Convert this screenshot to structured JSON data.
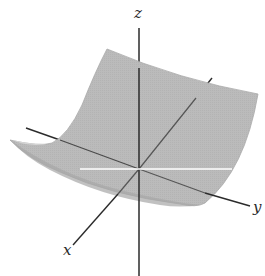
{
  "figure": {
    "type": "3d-surface-diagram",
    "surface_color": "#b9b9b9",
    "surface_edge_color": "#a2a2a2",
    "axis_color": "#2b2b2b",
    "highlight_line_color": "#ffffff"
  },
  "axes": {
    "x": {
      "label": "x"
    },
    "y": {
      "label": "y"
    },
    "z": {
      "label": "z"
    }
  }
}
